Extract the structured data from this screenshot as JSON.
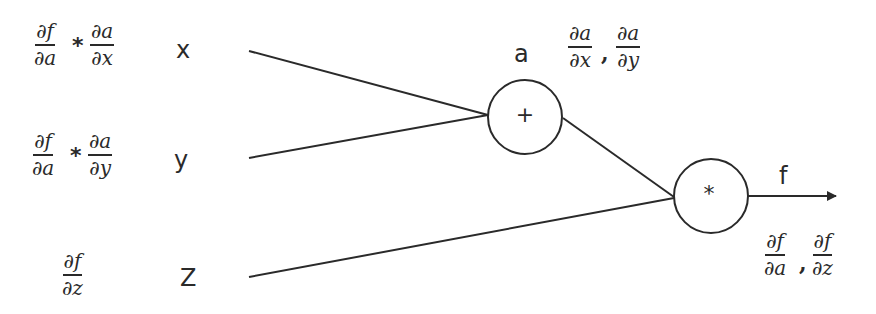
{
  "diagram": {
    "type": "computational-graph",
    "line_color": "#2a2a2a",
    "inputs": [
      {
        "label": "x",
        "gradient": {
          "left": {
            "num": "∂f",
            "den": "∂a"
          },
          "op": "*",
          "right": {
            "num": "∂a",
            "den": "∂x"
          }
        }
      },
      {
        "label": "y",
        "gradient": {
          "left": {
            "num": "∂f",
            "den": "∂a"
          },
          "op": "*",
          "right": {
            "num": "∂a",
            "den": "∂y"
          }
        }
      },
      {
        "label": "Z",
        "gradient": {
          "single": {
            "num": "∂f",
            "den": "∂z"
          }
        }
      }
    ],
    "nodes": [
      {
        "id": "add",
        "symbol": "+",
        "output_label": "a",
        "local_gradients": [
          {
            "num": "∂a",
            "den": "∂x"
          },
          {
            "num": "∂a",
            "den": "∂y"
          }
        ],
        "separator": ","
      },
      {
        "id": "mul",
        "symbol": "*",
        "output_label": "f",
        "local_gradients": [
          {
            "num": "∂f",
            "den": "∂a"
          },
          {
            "num": "∂f",
            "den": "∂z"
          }
        ],
        "separator": ","
      }
    ],
    "edges": [
      {
        "from": "x",
        "to": "add"
      },
      {
        "from": "y",
        "to": "add"
      },
      {
        "from": "add",
        "to": "mul"
      },
      {
        "from": "Z",
        "to": "mul"
      },
      {
        "from": "mul",
        "to": "output",
        "arrow": true
      }
    ]
  }
}
